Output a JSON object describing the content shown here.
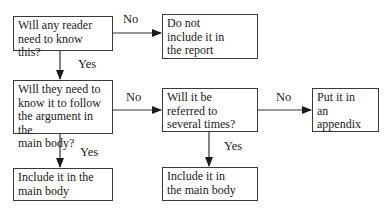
{
  "diagram": {
    "type": "flowchart",
    "nodes": [
      {
        "id": "q1",
        "label": "Will any reader need to know this?",
        "lines": [
          "Will any reader",
          "need to know this?"
        ]
      },
      {
        "id": "exclude",
        "label": "Do not include it in the report",
        "lines": [
          "Do not",
          "include it in",
          "the report"
        ]
      },
      {
        "id": "q2",
        "label": "Will they need to know it to follow the argument in the main body?",
        "lines": [
          "Will they need to",
          "know it to follow",
          "the argument in the",
          "main body?"
        ]
      },
      {
        "id": "q3",
        "label": "Will it be referred to several times?",
        "lines": [
          "Will it be",
          "referred to",
          "several times?"
        ]
      },
      {
        "id": "appendix",
        "label": "Put it in an appendix",
        "lines": [
          "Put it in",
          "an",
          "appendix"
        ]
      },
      {
        "id": "main1",
        "label": "Include it in the main body",
        "lines": [
          "Include it in the",
          "main body"
        ]
      },
      {
        "id": "main2",
        "label": "Include it in the main body",
        "lines": [
          "Include it in",
          "the main body"
        ]
      }
    ],
    "edges": [
      {
        "from": "q1",
        "to": "exclude",
        "label": "No"
      },
      {
        "from": "q1",
        "to": "q2",
        "label": "Yes"
      },
      {
        "from": "q2",
        "to": "q3",
        "label": "No"
      },
      {
        "from": "q2",
        "to": "main1",
        "label": "Yes"
      },
      {
        "from": "q3",
        "to": "appendix",
        "label": "No"
      },
      {
        "from": "q3",
        "to": "main2",
        "label": "Yes"
      }
    ]
  }
}
